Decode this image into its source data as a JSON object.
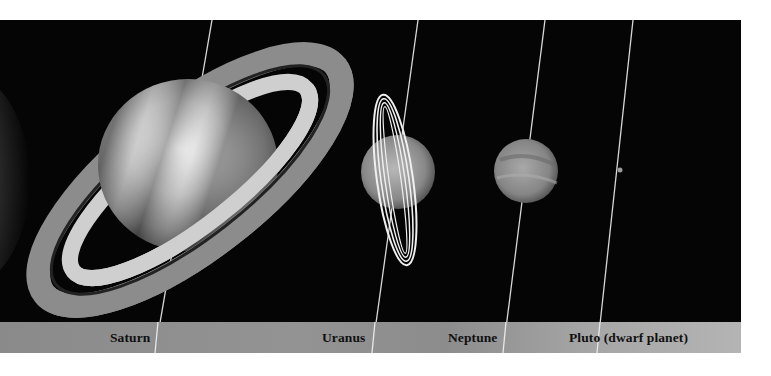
{
  "figure": {
    "labels": [
      {
        "name": "Saturn"
      },
      {
        "name": "Uranus"
      },
      {
        "name": "Neptune"
      },
      {
        "name": "Pluto (dwarf planet)"
      }
    ],
    "colors": {
      "background": "#050505",
      "label_bar": "#959595",
      "page": "#ffffff",
      "label_text": "#101010"
    }
  }
}
